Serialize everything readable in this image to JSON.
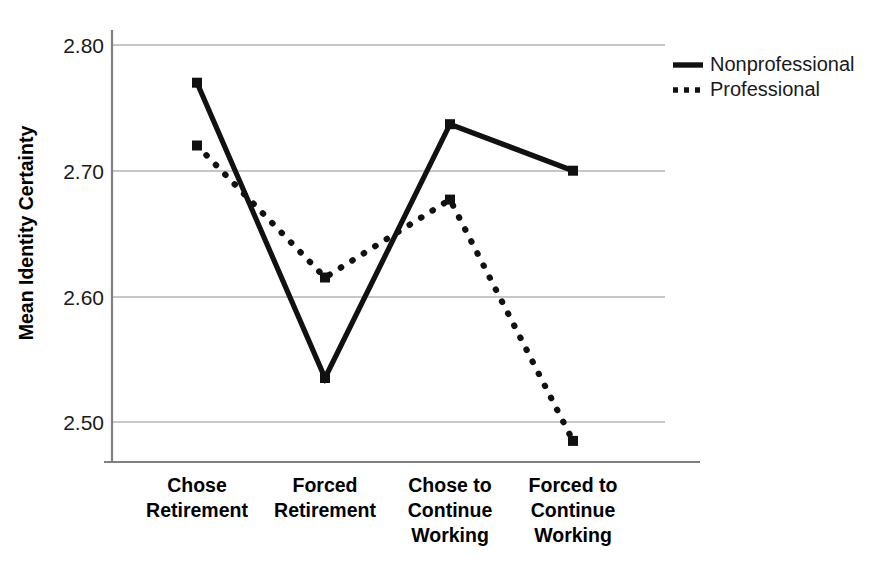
{
  "chart_data": {
    "type": "line",
    "title": "",
    "xlabel": "",
    "ylabel": "Mean Identity Certainty",
    "ylim": [
      2.45,
      2.82
    ],
    "yticks": [
      "2.50",
      "2.60",
      "2.70",
      "2.80"
    ],
    "ytick_values": [
      2.5,
      2.6,
      2.7,
      2.8
    ],
    "grid": true,
    "legend_position": "top-right",
    "categories": [
      "Chose Retirement",
      "Forced Retirement",
      "Chose to Continue Working",
      "Forced to Continue Working"
    ],
    "category_lines": [
      [
        "Chose",
        "Retirement"
      ],
      [
        "Forced",
        "Retirement"
      ],
      [
        "Chose to",
        "Continue",
        "Working"
      ],
      [
        "Forced to",
        "Continue",
        "Working"
      ]
    ],
    "series": [
      {
        "name": "Nonprofessional",
        "style": "solid",
        "color": "#111111",
        "marker": "square",
        "values": [
          2.77,
          2.535,
          2.737,
          2.7
        ]
      },
      {
        "name": "Professional",
        "style": "dotted",
        "color": "#111111",
        "marker": "square",
        "values": [
          2.72,
          2.615,
          2.677,
          2.485
        ]
      }
    ]
  },
  "legend": {
    "items": [
      {
        "label": "Nonprofessional",
        "style": "solid"
      },
      {
        "label": "Professional",
        "style": "dotted"
      }
    ]
  },
  "axes": {
    "y_title": "Mean Identity Certainty",
    "gridline_color": "#b4b4b4",
    "axis_color": "#808080"
  }
}
